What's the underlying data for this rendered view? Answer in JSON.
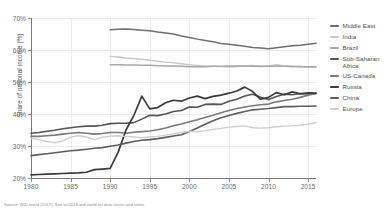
{
  "chart_data": {
    "type": "line",
    "title": "",
    "xlabel": "",
    "ylabel": "Share of national income (%)",
    "xlim": [
      1980,
      2016
    ],
    "ylim": [
      20,
      70
    ],
    "xticks": [
      "1980",
      "1985",
      "1990",
      "1995",
      "2000",
      "2005",
      "2010",
      "2015"
    ],
    "yticks": [
      "20%",
      "30%",
      "40%",
      "50%",
      "60%",
      "70%"
    ],
    "grid": true,
    "legend_position": "right",
    "series": [
      {
        "name": "Middle East",
        "color": "#6f6f6f",
        "width": 1.5,
        "x": [
          1990,
          1991,
          1992,
          1993,
          1994,
          1995,
          1996,
          1997,
          1998,
          1999,
          2000,
          2001,
          2002,
          2003,
          2004,
          2005,
          2006,
          2007,
          2008,
          2009,
          2010,
          2011,
          2012,
          2013,
          2014,
          2015,
          2016
        ],
        "values": [
          66.3,
          66.5,
          66.6,
          66.4,
          66.2,
          66.0,
          65.6,
          65.3,
          65.0,
          64.4,
          63.9,
          63.4,
          63.0,
          62.6,
          62.0,
          61.8,
          61.5,
          61.2,
          60.8,
          60.6,
          60.4,
          60.7,
          61.0,
          61.3,
          61.5,
          61.8,
          62.1
        ]
      },
      {
        "name": "India",
        "color": "#c9c9c9",
        "width": 1.4,
        "x": [
          1990,
          1991,
          1992,
          1993,
          1994,
          1995,
          1996,
          1997,
          1998,
          1999,
          2000,
          2001,
          2002,
          2003,
          2004,
          2005,
          2006,
          2007,
          2008,
          2009,
          2010,
          2011,
          2012,
          2013,
          2014,
          2015,
          2016
        ],
        "values": [
          58.0,
          57.8,
          57.5,
          57.3,
          57.1,
          56.8,
          56.5,
          56.2,
          56.0,
          55.7,
          55.4,
          55.2,
          55.0,
          54.9,
          54.8,
          54.7,
          54.8,
          55.0,
          55.2,
          54.8,
          55.0,
          55.4,
          55.0,
          54.7,
          54.9,
          54.7,
          54.6
        ]
      },
      {
        "name": "Brazil",
        "color": "#a8a8a8",
        "width": 1.5,
        "x": [
          1990,
          1991,
          1992,
          1993,
          1994,
          1995,
          1996,
          1997,
          1998,
          1999,
          2000,
          2001,
          2002,
          2003,
          2004,
          2005,
          2006,
          2007,
          2008,
          2009,
          2010,
          2011,
          2012,
          2013,
          2014,
          2015,
          2016
        ],
        "values": [
          55.4,
          55.4,
          55.3,
          55.3,
          55.2,
          55.2,
          55.1,
          55.0,
          55.0,
          54.9,
          54.8,
          54.8,
          54.8,
          54.9,
          54.9,
          55.0,
          55.0,
          55.0,
          54.9,
          54.9,
          54.9,
          54.9,
          54.9,
          54.9,
          54.8,
          54.8,
          54.8
        ]
      },
      {
        "name": "Sub-Saharan Africa",
        "color": "#555555",
        "width": 1.6,
        "x": [
          1980,
          1981,
          1982,
          1983,
          1984,
          1985,
          1986,
          1987,
          1988,
          1989,
          1990,
          1991,
          1992,
          1993,
          1994,
          1995,
          1996,
          1997,
          1998,
          1999,
          2000,
          2001,
          2002,
          2003,
          2004,
          2005,
          2006,
          2007,
          2008,
          2009,
          2010,
          2011,
          2012,
          2013,
          2014,
          2015,
          2016
        ],
        "values": [
          34.0,
          34.2,
          34.6,
          34.9,
          35.4,
          35.7,
          36.0,
          36.2,
          36.2,
          36.5,
          37.0,
          37.1,
          37.1,
          37.3,
          38.4,
          39.6,
          39.5,
          40.0,
          40.8,
          41.1,
          42.2,
          42.1,
          43.0,
          43.1,
          43.0,
          44.0,
          44.6,
          45.6,
          46.2,
          45.2,
          44.5,
          45.5,
          46.2,
          46.0,
          46.4,
          46.3,
          46.4
        ]
      },
      {
        "name": "US-Canada",
        "color": "#7a7a7a",
        "width": 1.6,
        "x": [
          1980,
          1981,
          1982,
          1983,
          1984,
          1985,
          1986,
          1987,
          1988,
          1989,
          1990,
          1991,
          1992,
          1993,
          1994,
          1995,
          1996,
          1997,
          1998,
          1999,
          2000,
          2001,
          2002,
          2003,
          2004,
          2005,
          2006,
          2007,
          2008,
          2009,
          2010,
          2011,
          2012,
          2013,
          2014,
          2015,
          2016
        ],
        "values": [
          33.0,
          33.0,
          33.2,
          33.4,
          33.7,
          34.0,
          34.2,
          34.0,
          33.7,
          33.9,
          34.2,
          34.2,
          34.0,
          34.3,
          34.5,
          34.7,
          35.1,
          35.6,
          36.3,
          36.9,
          37.6,
          38.2,
          38.9,
          39.6,
          40.4,
          41.1,
          41.7,
          42.2,
          42.6,
          42.9,
          43.1,
          43.8,
          44.2,
          44.6,
          45.2,
          45.9,
          46.4
        ]
      },
      {
        "name": "Russia",
        "color": "#3a3a3a",
        "width": 1.7,
        "x": [
          1980,
          1981,
          1982,
          1983,
          1984,
          1985,
          1986,
          1987,
          1988,
          1989,
          1990,
          1991,
          1992,
          1993,
          1994,
          1995,
          1996,
          1997,
          1998,
          1999,
          2000,
          2001,
          2002,
          2003,
          2004,
          2005,
          2006,
          2007,
          2008,
          2009,
          2010,
          2011,
          2012,
          2013,
          2014,
          2015,
          2016
        ],
        "values": [
          21.0,
          21.1,
          21.2,
          21.3,
          21.4,
          21.5,
          21.6,
          21.8,
          22.6,
          22.8,
          23.0,
          28.0,
          35.0,
          39.6,
          45.6,
          41.6,
          42.0,
          43.5,
          44.3,
          44.0,
          45.0,
          45.6,
          44.8,
          45.5,
          45.9,
          46.5,
          47.2,
          48.4,
          47.0,
          44.6,
          45.2,
          46.7,
          46.0,
          46.9,
          46.3,
          46.6,
          46.5
        ]
      },
      {
        "name": "China",
        "color": "#5e5e5e",
        "width": 1.6,
        "x": [
          1980,
          1981,
          1982,
          1983,
          1984,
          1985,
          1986,
          1987,
          1988,
          1989,
          1990,
          1991,
          1992,
          1993,
          1994,
          1995,
          1996,
          1997,
          1998,
          1999,
          2000,
          2001,
          2002,
          2003,
          2004,
          2005,
          2006,
          2007,
          2008,
          2009,
          2010,
          2011,
          2012,
          2013,
          2014,
          2015,
          2016
        ],
        "values": [
          27.0,
          27.3,
          27.6,
          27.9,
          28.2,
          28.5,
          28.7,
          29.0,
          29.3,
          29.5,
          29.9,
          30.3,
          30.9,
          31.4,
          31.8,
          32.0,
          32.3,
          32.7,
          33.1,
          33.5,
          34.5,
          35.6,
          36.8,
          37.9,
          38.8,
          39.5,
          40.2,
          40.8,
          41.3,
          41.5,
          41.7,
          42.0,
          42.3,
          42.3,
          42.4,
          42.4,
          42.5
        ]
      },
      {
        "name": "Europe",
        "color": "#cfcfcf",
        "width": 1.4,
        "x": [
          1980,
          1981,
          1982,
          1983,
          1984,
          1985,
          1986,
          1987,
          1988,
          1989,
          1990,
          1991,
          1992,
          1993,
          1994,
          1995,
          1996,
          1997,
          1998,
          1999,
          2000,
          2001,
          2002,
          2003,
          2004,
          2005,
          2006,
          2007,
          2008,
          2009,
          2010,
          2011,
          2012,
          2013,
          2014,
          2015,
          2016
        ],
        "values": [
          32.4,
          32.0,
          31.4,
          31.0,
          31.6,
          32.8,
          33.2,
          32.8,
          32.0,
          32.7,
          33.1,
          33.2,
          33.0,
          32.8,
          32.6,
          32.8,
          33.0,
          33.4,
          33.8,
          34.2,
          34.6,
          34.5,
          34.8,
          35.2,
          35.5,
          35.9,
          36.1,
          36.3,
          35.7,
          35.6,
          35.7,
          36.0,
          36.2,
          36.3,
          36.5,
          36.8,
          37.3
        ]
      }
    ]
  },
  "legend": {
    "items": [
      {
        "label": "Middle East"
      },
      {
        "label": "India"
      },
      {
        "label": "Brazil"
      },
      {
        "label": "Sub-Saharan Africa"
      },
      {
        "label": "US-Canada"
      },
      {
        "label": "Russia"
      },
      {
        "label": "China"
      },
      {
        "label": "Europe"
      }
    ]
  },
  "footer": {
    "source": "Source: WID.world (2017). See wir2018.wid.world for data series and notes."
  }
}
